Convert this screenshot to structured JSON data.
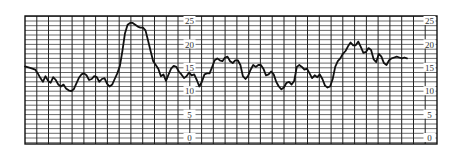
{
  "chart_data": {
    "type": "line",
    "title": "",
    "xlabel": "",
    "ylabel": "",
    "ylim": [
      0,
      25
    ],
    "yticks": [
      0,
      5,
      10,
      15,
      20,
      25
    ],
    "ytick_label_columns": [
      "mid",
      "right"
    ],
    "grid": true,
    "legend": null,
    "series": [
      {
        "name": "trace",
        "points": [
          [
            0,
            15.3
          ],
          [
            2,
            15.0
          ],
          [
            4,
            14.6
          ],
          [
            5,
            13.8
          ],
          [
            6,
            12.8
          ],
          [
            7,
            12.0
          ],
          [
            8,
            13.2
          ],
          [
            9,
            12.2
          ],
          [
            10,
            11.8
          ],
          [
            11,
            13.0
          ],
          [
            12,
            12.4
          ],
          [
            13,
            11.4
          ],
          [
            14,
            11.0
          ],
          [
            15,
            11.4
          ],
          [
            16,
            10.6
          ],
          [
            17,
            10.2
          ],
          [
            18,
            10.0
          ],
          [
            19,
            10.4
          ],
          [
            20,
            11.6
          ],
          [
            21,
            12.8
          ],
          [
            22,
            13.6
          ],
          [
            23,
            13.8
          ],
          [
            24,
            13.4
          ],
          [
            25,
            12.4
          ],
          [
            26,
            12.6
          ],
          [
            27,
            13.2
          ],
          [
            28,
            13.0
          ],
          [
            29,
            12.0
          ],
          [
            30,
            12.6
          ],
          [
            31,
            12.8
          ],
          [
            32,
            11.6
          ],
          [
            33,
            11.0
          ],
          [
            34,
            11.4
          ],
          [
            35,
            12.6
          ],
          [
            36,
            13.8
          ],
          [
            37,
            15.4
          ],
          [
            38,
            18.6
          ],
          [
            39,
            22.4
          ],
          [
            40,
            24.2
          ],
          [
            41,
            24.6
          ],
          [
            42,
            24.6
          ],
          [
            43,
            24.2
          ],
          [
            44,
            23.8
          ],
          [
            45,
            23.6
          ],
          [
            46,
            23.6
          ],
          [
            47,
            23.0
          ],
          [
            48,
            20.8
          ],
          [
            49,
            18.6
          ],
          [
            50,
            16.4
          ],
          [
            51,
            15.6
          ],
          [
            52,
            14.8
          ],
          [
            53,
            13.2
          ],
          [
            54,
            13.6
          ],
          [
            55,
            12.2
          ],
          [
            56,
            13.6
          ],
          [
            57,
            14.8
          ],
          [
            58,
            15.4
          ],
          [
            59,
            15.2
          ],
          [
            60,
            14.2
          ],
          [
            61,
            13.6
          ],
          [
            62,
            12.8
          ],
          [
            63,
            13.2
          ],
          [
            64,
            14.0
          ],
          [
            65,
            13.4
          ],
          [
            66,
            13.6
          ],
          [
            67,
            12.4
          ],
          [
            68,
            11.0
          ],
          [
            69,
            12.0
          ],
          [
            70,
            13.6
          ],
          [
            71,
            13.8
          ],
          [
            72,
            13.8
          ],
          [
            73,
            15.2
          ],
          [
            74,
            16.6
          ],
          [
            75,
            17.0
          ],
          [
            76,
            16.6
          ],
          [
            77,
            16.4
          ],
          [
            78,
            17.2
          ],
          [
            79,
            17.4
          ],
          [
            80,
            16.4
          ],
          [
            81,
            16.0
          ],
          [
            82,
            16.6
          ],
          [
            83,
            16.6
          ],
          [
            84,
            15.6
          ],
          [
            85,
            13.2
          ],
          [
            86,
            12.6
          ],
          [
            87,
            13.2
          ],
          [
            88,
            14.6
          ],
          [
            89,
            15.6
          ],
          [
            90,
            15.2
          ],
          [
            91,
            15.6
          ],
          [
            92,
            15.6
          ],
          [
            93,
            14.8
          ],
          [
            94,
            13.4
          ],
          [
            95,
            13.6
          ],
          [
            96,
            14.2
          ],
          [
            97,
            13.6
          ],
          [
            98,
            12.0
          ],
          [
            99,
            11.0
          ],
          [
            100,
            10.4
          ],
          [
            101,
            10.8
          ],
          [
            102,
            11.8
          ],
          [
            103,
            12.0
          ],
          [
            104,
            11.4
          ],
          [
            105,
            12.2
          ],
          [
            106,
            15.2
          ],
          [
            107,
            15.6
          ],
          [
            108,
            15.2
          ],
          [
            109,
            14.6
          ],
          [
            110,
            14.8
          ],
          [
            111,
            13.8
          ],
          [
            112,
            12.8
          ],
          [
            113,
            13.4
          ],
          [
            114,
            13.0
          ],
          [
            115,
            13.6
          ],
          [
            116,
            12.6
          ],
          [
            117,
            11.2
          ],
          [
            118,
            10.8
          ],
          [
            119,
            11.0
          ],
          [
            120,
            12.6
          ],
          [
            121,
            15.2
          ],
          [
            122,
            16.4
          ],
          [
            123,
            17.0
          ],
          [
            124,
            18.0
          ],
          [
            125,
            18.6
          ],
          [
            126,
            19.6
          ],
          [
            127,
            20.4
          ],
          [
            128,
            19.8
          ],
          [
            129,
            19.8
          ],
          [
            130,
            20.6
          ],
          [
            131,
            19.4
          ],
          [
            132,
            18.2
          ],
          [
            133,
            18.4
          ],
          [
            134,
            19.2
          ],
          [
            135,
            18.8
          ],
          [
            136,
            16.8
          ],
          [
            137,
            16.2
          ],
          [
            138,
            18.0
          ],
          [
            139,
            17.4
          ],
          [
            140,
            16.0
          ],
          [
            141,
            15.6
          ],
          [
            142,
            16.6
          ],
          [
            143,
            17.0
          ],
          [
            144,
            17.2
          ],
          [
            145,
            17.4
          ],
          [
            146,
            17.2
          ],
          [
            147,
            17.0
          ],
          [
            148,
            17.2
          ],
          [
            149,
            17.0
          ]
        ]
      }
    ]
  }
}
